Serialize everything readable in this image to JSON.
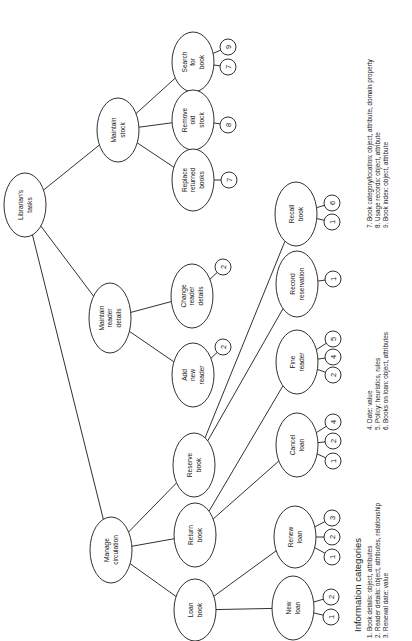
{
  "diagram": {
    "type": "hierarchical task analysis tree",
    "orientation": "rotated 90 degrees counter-clockwise",
    "root": "Librarian's tasks",
    "nodes": [
      {
        "id": "root",
        "lines": [
          "Librarian's",
          "tasks"
        ],
        "cx": 25,
        "cy": 205,
        "rx": 21,
        "ry": 32
      },
      {
        "id": "maintain_stock",
        "lines": [
          "Maintain",
          "stock"
        ],
        "cx": 118,
        "cy": 130,
        "rx": 21,
        "ry": 32
      },
      {
        "id": "maintain_reader",
        "lines": [
          "Maintain",
          "reader",
          "details"
        ],
        "cx": 110,
        "cy": 318,
        "rx": 21,
        "ry": 35
      },
      {
        "id": "manage_circ",
        "lines": [
          "Manage",
          "circulation"
        ],
        "cx": 111,
        "cy": 550,
        "rx": 21,
        "ry": 33
      },
      {
        "id": "search_book",
        "lines": [
          "Search",
          "for",
          "book"
        ],
        "cx": 193,
        "cy": 62,
        "rx": 21,
        "ry": 30
      },
      {
        "id": "remove_stock",
        "lines": [
          "Remove",
          "old",
          "stock"
        ],
        "cx": 193,
        "cy": 120,
        "rx": 21,
        "ry": 30
      },
      {
        "id": "replace_books",
        "lines": [
          "Replace",
          "returned",
          "books"
        ],
        "cx": 193,
        "cy": 180,
        "rx": 21,
        "ry": 31
      },
      {
        "id": "change_reader",
        "lines": [
          "Change",
          "reader",
          "details"
        ],
        "cx": 192,
        "cy": 296,
        "rx": 21,
        "ry": 32
      },
      {
        "id": "add_reader",
        "lines": [
          "Add",
          "new",
          "reader"
        ],
        "cx": 193,
        "cy": 375,
        "rx": 21,
        "ry": 32
      },
      {
        "id": "reserve_book",
        "lines": [
          "Reserve",
          "book"
        ],
        "cx": 194,
        "cy": 465,
        "rx": 21,
        "ry": 32
      },
      {
        "id": "return_book",
        "lines": [
          "Return",
          "book"
        ],
        "cx": 195,
        "cy": 535,
        "rx": 21,
        "ry": 32
      },
      {
        "id": "loan_book",
        "lines": [
          "Loan",
          "book"
        ],
        "cx": 195,
        "cy": 610,
        "rx": 21,
        "ry": 31
      },
      {
        "id": "recall_book",
        "lines": [
          "Recall",
          "book"
        ],
        "cx": 296,
        "cy": 214,
        "rx": 21,
        "ry": 32
      },
      {
        "id": "record_reservation",
        "lines": [
          "Record",
          "reservation"
        ],
        "cx": 297,
        "cy": 284,
        "rx": 21,
        "ry": 33
      },
      {
        "id": "fine_reader",
        "lines": [
          "Fine",
          "reader"
        ],
        "cx": 297,
        "cy": 362,
        "rx": 21,
        "ry": 32
      },
      {
        "id": "cancel_loan",
        "lines": [
          "Cancel",
          "loan"
        ],
        "cx": 297,
        "cy": 445,
        "rx": 21,
        "ry": 32
      },
      {
        "id": "renew_loan",
        "lines": [
          "Renew",
          "loan"
        ],
        "cx": 295,
        "cy": 537,
        "rx": 21,
        "ry": 31
      },
      {
        "id": "new_loan",
        "lines": [
          "New",
          "loan"
        ],
        "cx": 293,
        "cy": 608,
        "rx": 21,
        "ry": 32
      }
    ],
    "edges": [
      [
        "root",
        "maintain_stock"
      ],
      [
        "root",
        "maintain_reader"
      ],
      [
        "root",
        "manage_circ"
      ],
      [
        "maintain_stock",
        "search_book"
      ],
      [
        "maintain_stock",
        "remove_stock"
      ],
      [
        "maintain_stock",
        "replace_books"
      ],
      [
        "maintain_reader",
        "change_reader"
      ],
      [
        "maintain_reader",
        "add_reader"
      ],
      [
        "manage_circ",
        "reserve_book"
      ],
      [
        "manage_circ",
        "return_book"
      ],
      [
        "manage_circ",
        "loan_book"
      ],
      [
        "reserve_book",
        "recall_book"
      ],
      [
        "reserve_book",
        "record_reservation"
      ],
      [
        "return_book",
        "fine_reader"
      ],
      [
        "return_book",
        "cancel_loan"
      ],
      [
        "loan_book",
        "renew_loan"
      ],
      [
        "loan_book",
        "new_loan"
      ]
    ],
    "info_tags": [
      {
        "node": "search_book",
        "items": [
          {
            "n": "9",
            "cx": 228,
            "cy": 47
          },
          {
            "n": "7",
            "cx": 228,
            "cy": 67
          }
        ]
      },
      {
        "node": "remove_stock",
        "items": [
          {
            "n": "8",
            "cx": 228,
            "cy": 125
          }
        ]
      },
      {
        "node": "replace_books",
        "items": [
          {
            "n": "7",
            "cx": 229,
            "cy": 180
          }
        ]
      },
      {
        "node": "change_reader",
        "items": [
          {
            "n": "2",
            "cx": 223,
            "cy": 267
          }
        ]
      },
      {
        "node": "add_reader",
        "items": [
          {
            "n": "2",
            "cx": 223,
            "cy": 347
          }
        ]
      },
      {
        "node": "recall_book",
        "items": [
          {
            "n": "6",
            "cx": 332,
            "cy": 203
          },
          {
            "n": "1",
            "cx": 332,
            "cy": 222
          }
        ]
      },
      {
        "node": "record_reservation",
        "items": [
          {
            "n": "1",
            "cx": 333,
            "cy": 279
          }
        ]
      },
      {
        "node": "fine_reader",
        "items": [
          {
            "n": "5",
            "cx": 333,
            "cy": 339
          },
          {
            "n": "4",
            "cx": 333,
            "cy": 357
          },
          {
            "n": "2",
            "cx": 333,
            "cy": 375
          }
        ]
      },
      {
        "node": "cancel_loan",
        "items": [
          {
            "n": "4",
            "cx": 333,
            "cy": 422
          },
          {
            "n": "2",
            "cx": 333,
            "cy": 441
          },
          {
            "n": "1",
            "cx": 333,
            "cy": 461
          }
        ]
      },
      {
        "node": "renew_loan",
        "items": [
          {
            "n": "3",
            "cx": 332,
            "cy": 518
          },
          {
            "n": "2",
            "cx": 332,
            "cy": 537
          },
          {
            "n": "1",
            "cx": 332,
            "cy": 557
          }
        ]
      },
      {
        "node": "new_loan",
        "items": [
          {
            "n": "2",
            "cx": 331,
            "cy": 597
          },
          {
            "n": "1",
            "cx": 331,
            "cy": 617
          }
        ]
      }
    ]
  },
  "legend": {
    "title": "Information categories",
    "columns": [
      {
        "x": 372,
        "y": 638,
        "items": [
          "1. Book details: object, attributes",
          "2. Reader details: object, attributes, relationship",
          "3. Renewal date: value"
        ]
      },
      {
        "x": 372,
        "y": 430,
        "items": [
          "4. Date: value",
          "5. Policy: heuristics, rules",
          "6. Books on loan: object, attributes"
        ]
      },
      {
        "x": 372,
        "y": 228,
        "items": [
          "7. Book category/location: object, attribute, domain property",
          "8. Usage records: object, attribute",
          "9. Book index: object, attribute"
        ]
      }
    ]
  }
}
